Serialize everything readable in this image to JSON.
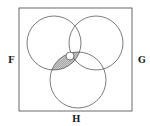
{
  "diagram": {
    "type": "venn",
    "sets": [
      {
        "label": "F",
        "cx": 54,
        "cy": 43,
        "r": 27
      },
      {
        "label": "G",
        "cx": 96,
        "cy": 43,
        "r": 27
      },
      {
        "label": "H",
        "cx": 78,
        "cy": 80,
        "r": 28
      }
    ],
    "universe": {
      "x": 19,
      "y": 8,
      "w": 113,
      "h": 103
    },
    "shaded_region": "F ∩ H (excluding G)",
    "marked_point": {
      "cx": 70,
      "cy": 56,
      "r": 4
    },
    "colors": {
      "stroke": "#444444",
      "shade": "#bdbdbd",
      "background": "#ffffff"
    }
  },
  "labels": {
    "f": "F",
    "g": "G",
    "h": "H"
  }
}
